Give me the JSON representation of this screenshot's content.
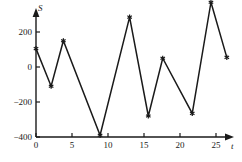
{
  "chart_data": {
    "type": "line",
    "title": "",
    "xlabel": "t",
    "ylabel": "S",
    "xlim": [
      0,
      26.5
    ],
    "ylim": [
      -400,
      400
    ],
    "grid": false,
    "legend": null,
    "markers": "asterisk",
    "line_color": "#1a1a1a",
    "axis_color": "#1a1a1a",
    "x": [
      0,
      2.1,
      3.8,
      8.9,
      13.0,
      15.6,
      17.6,
      21.7,
      24.3,
      26.5
    ],
    "values": [
      105,
      -110,
      150,
      -390,
      285,
      -280,
      50,
      -265,
      370,
      55
    ],
    "points": [
      {
        "t": 0,
        "S": 105
      },
      {
        "t": 2.1,
        "S": -110
      },
      {
        "t": 3.8,
        "S": 150
      },
      {
        "t": 8.9,
        "S": -390
      },
      {
        "t": 13.0,
        "S": 285
      },
      {
        "t": 15.6,
        "S": -280
      },
      {
        "t": 17.6,
        "S": 50
      },
      {
        "t": 21.7,
        "S": -265
      },
      {
        "t": 24.3,
        "S": 370
      },
      {
        "t": 26.5,
        "S": 55
      }
    ],
    "xticks": [
      {
        "value": 0,
        "label": "0"
      },
      {
        "value": 5,
        "label": "5"
      },
      {
        "value": 10,
        "label": "10"
      },
      {
        "value": 15,
        "label": "15"
      },
      {
        "value": 20,
        "label": "20"
      },
      {
        "value": 25,
        "label": "25"
      }
    ],
    "yticks": [
      {
        "value": 200,
        "label": "200"
      },
      {
        "value": 0,
        "label": "0"
      },
      {
        "value": -200,
        "label": "−200"
      },
      {
        "value": -400,
        "label": "−400"
      }
    ]
  }
}
